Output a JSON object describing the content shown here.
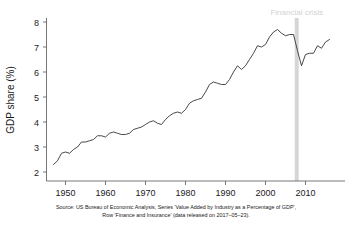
{
  "chart_data": {
    "type": "line",
    "title": "",
    "xlabel": "",
    "ylabel": "GDP share (%)",
    "xlim": [
      1947,
      2016
    ],
    "ylim": [
      1.8,
      8.2
    ],
    "grid": false,
    "legend_position": "none",
    "x_tick_labels": [
      "1950",
      "1960",
      "1970",
      "1980",
      "1990",
      "2000",
      "2010"
    ],
    "x_ticks": [
      1950,
      1960,
      1970,
      1980,
      1990,
      2000,
      2010
    ],
    "y_tick_labels": [
      "2",
      "3",
      "4",
      "5",
      "6",
      "7",
      "8"
    ],
    "y_ticks": [
      2,
      3,
      4,
      5,
      6,
      7,
      8
    ],
    "series": [
      {
        "name": "Finance and Insurance share of GDP",
        "x": [
          1947,
          1948,
          1949,
          1950,
          1951,
          1952,
          1953,
          1954,
          1955,
          1956,
          1957,
          1958,
          1959,
          1960,
          1961,
          1962,
          1963,
          1964,
          1965,
          1966,
          1967,
          1968,
          1969,
          1970,
          1971,
          1972,
          1973,
          1974,
          1975,
          1976,
          1977,
          1978,
          1979,
          1980,
          1981,
          1982,
          1983,
          1984,
          1985,
          1986,
          1987,
          1988,
          1989,
          1990,
          1991,
          1992,
          1993,
          1994,
          1995,
          1996,
          1997,
          1998,
          1999,
          2000,
          2001,
          2002,
          2003,
          2004,
          2005,
          2006,
          2007,
          2008,
          2009,
          2010,
          2011,
          2012,
          2013,
          2014,
          2015,
          2016
        ],
        "values": [
          2.3,
          2.45,
          2.75,
          2.8,
          2.75,
          2.9,
          3.0,
          3.2,
          3.2,
          3.25,
          3.3,
          3.45,
          3.45,
          3.4,
          3.55,
          3.6,
          3.55,
          3.5,
          3.5,
          3.55,
          3.7,
          3.75,
          3.8,
          3.9,
          4.0,
          4.05,
          3.95,
          3.9,
          4.1,
          4.25,
          4.35,
          4.4,
          4.35,
          4.5,
          4.75,
          4.85,
          4.9,
          4.95,
          5.2,
          5.5,
          5.6,
          5.55,
          5.5,
          5.5,
          5.7,
          6.0,
          6.25,
          6.1,
          6.25,
          6.5,
          6.75,
          7.05,
          7.0,
          7.1,
          7.4,
          7.6,
          7.7,
          7.55,
          7.45,
          7.5,
          7.5,
          6.85,
          6.25,
          6.7,
          6.75,
          6.75,
          7.05,
          6.95,
          7.2,
          7.3
        ]
      }
    ],
    "annotations": [
      {
        "name": "financial-crisis",
        "label": "Financial crisis",
        "type": "vertical-band",
        "x_start": 2007.3,
        "x_end": 2008.3,
        "color": "#d6d6d6",
        "label_color": "#d2d2d2"
      }
    ],
    "caption": {
      "line1": "Source: US Bureau of Economic Analysis, Series 'Value Added by Industry as a Percentage of GDP',",
      "line2": "Row 'Finance and Insurance' (data released on 2017–05–23)."
    }
  },
  "axes": {
    "y_title": "GDP share (%)",
    "y_tick_labels": [
      "8",
      "7",
      "6",
      "5",
      "4",
      "3",
      "2"
    ],
    "x_tick_labels": [
      "1950",
      "1960",
      "1970",
      "1980",
      "1990",
      "2000",
      "2010"
    ]
  },
  "annotation": {
    "financial_crisis_label": "Financial crisis"
  },
  "caption": {
    "line1": "Source: US Bureau of Economic Analysis, Series 'Value Added by Industry as a Percentage of GDP',",
    "line2": "Row 'Finance and Insurance' (data released on 2017–05–23)."
  },
  "colors": {
    "series": "#333333",
    "axis": "#555555",
    "band": "#d6d6d6",
    "annotation_text": "#d2d2d2",
    "text": "#1a1a1a",
    "background": "#ffffff"
  }
}
